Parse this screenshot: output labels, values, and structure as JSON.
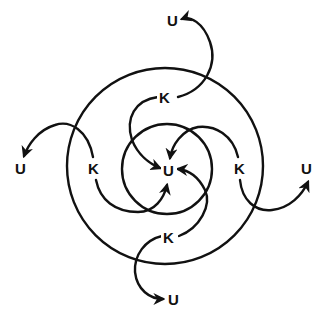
{
  "diagram": {
    "type": "concentric-circles-flow",
    "center_label": "U",
    "ring_labels": [
      "K",
      "K",
      "K",
      "K"
    ],
    "outer_labels": [
      "U",
      "U",
      "U",
      "U"
    ],
    "nodes": {
      "top_k": "K",
      "left_k": "K",
      "right_k": "K",
      "bottom_k": "K",
      "center_u": "U",
      "top_u": "U",
      "left_u": "U",
      "right_u": "U",
      "bottom_u": "U"
    },
    "edges": [
      {
        "from": "top_k",
        "to": "top_u"
      },
      {
        "from": "top_k",
        "to": "center_u"
      },
      {
        "from": "left_k",
        "to": "left_u"
      },
      {
        "from": "left_k",
        "to": "center_u"
      },
      {
        "from": "right_k",
        "to": "right_u"
      },
      {
        "from": "right_k",
        "to": "center_u"
      },
      {
        "from": "bottom_k",
        "to": "bottom_u"
      },
      {
        "from": "bottom_k",
        "to": "center_u"
      }
    ],
    "colors": {
      "stroke": "#111111",
      "background": "#ffffff"
    }
  }
}
